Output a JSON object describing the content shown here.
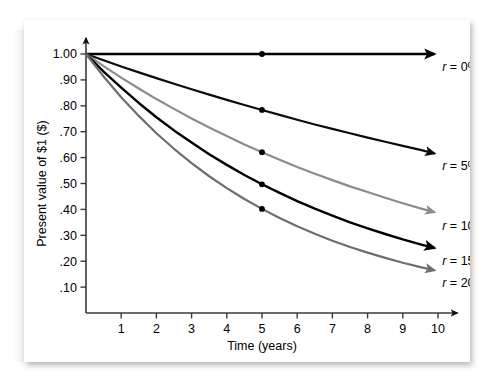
{
  "chart_data": {
    "type": "line",
    "title": "",
    "subtitle": "",
    "xlabel": "Time (years)",
    "ylabel": "Present value of $1 ($)",
    "xlim": [
      0,
      10.6
    ],
    "ylim": [
      0,
      1.06
    ],
    "xticks": [
      1,
      2,
      3,
      4,
      5,
      6,
      7,
      8,
      9,
      10
    ],
    "xtick_labels": [
      "1",
      "2",
      "3",
      "4",
      "5",
      "6",
      "7",
      "8",
      "9",
      "10"
    ],
    "yticks": [
      0.1,
      0.2,
      0.3,
      0.4,
      0.5,
      0.6,
      0.7,
      0.8,
      0.9,
      1.0
    ],
    "ytick_labels": [
      ".10",
      ".20",
      ".30",
      ".40",
      ".50",
      ".60",
      ".70",
      ".80",
      ".90",
      "1.00"
    ],
    "grid": false,
    "legend_position": "right-inline-end-of-line",
    "marker_x": 5,
    "x": [
      0,
      0.5,
      1,
      1.5,
      2,
      2.5,
      3,
      3.5,
      4,
      4.5,
      5,
      5.5,
      6,
      6.5,
      7,
      7.5,
      8,
      8.5,
      9,
      9.5,
      9.9
    ],
    "series": [
      {
        "name": "r = 0%",
        "rate": 0,
        "color": "#000000",
        "width": 2.4,
        "marker_value": 1.0,
        "end_value": 1.0,
        "values": [
          1.0,
          1.0,
          1.0,
          1.0,
          1.0,
          1.0,
          1.0,
          1.0,
          1.0,
          1.0,
          1.0,
          1.0,
          1.0,
          1.0,
          1.0,
          1.0,
          1.0,
          1.0,
          1.0,
          1.0,
          1.0
        ]
      },
      {
        "name": "r = 5%",
        "rate": 0.05,
        "color": "#0d0d0d",
        "width": 2.2,
        "marker_value": 0.784,
        "end_value": 0.614,
        "values": [
          1.0,
          0.976,
          0.952,
          0.929,
          0.907,
          0.885,
          0.864,
          0.843,
          0.823,
          0.803,
          0.784,
          0.765,
          0.746,
          0.728,
          0.711,
          0.694,
          0.677,
          0.661,
          0.645,
          0.63,
          0.616
        ]
      },
      {
        "name": "r = 10%",
        "rate": 0.1,
        "color": "#8c8c8c",
        "width": 2.2,
        "marker_value": 0.621,
        "end_value": 0.386,
        "values": [
          1.0,
          0.953,
          0.909,
          0.867,
          0.826,
          0.788,
          0.751,
          0.716,
          0.683,
          0.651,
          0.621,
          0.592,
          0.564,
          0.538,
          0.513,
          0.489,
          0.467,
          0.445,
          0.424,
          0.404,
          0.389
        ]
      },
      {
        "name": "r = 15%",
        "rate": 0.15,
        "color": "#000000",
        "width": 2.4,
        "marker_value": 0.497,
        "end_value": 0.25,
        "values": [
          1.0,
          0.932,
          0.87,
          0.811,
          0.756,
          0.705,
          0.658,
          0.613,
          0.572,
          0.533,
          0.497,
          0.464,
          0.432,
          0.403,
          0.376,
          0.35,
          0.327,
          0.305,
          0.284,
          0.265,
          0.251
        ]
      },
      {
        "name": "r = 20%",
        "rate": 0.2,
        "color": "#6e6e6e",
        "width": 2.2,
        "marker_value": 0.402,
        "end_value": 0.164,
        "values": [
          1.0,
          0.913,
          0.833,
          0.761,
          0.694,
          0.634,
          0.579,
          0.528,
          0.482,
          0.44,
          0.402,
          0.367,
          0.335,
          0.306,
          0.279,
          0.255,
          0.233,
          0.213,
          0.194,
          0.177,
          0.165
        ]
      }
    ],
    "legend_entries": [
      {
        "label": "r = 0%",
        "symbol": "r",
        "rest": " = 0%"
      },
      {
        "label": "r = 5%",
        "symbol": "r",
        "rest": " = 5%"
      },
      {
        "label": "r = 10%",
        "symbol": "r",
        "rest": " = 10%"
      },
      {
        "label": "r = 15%",
        "symbol": "r",
        "rest": " = 15%"
      },
      {
        "label": "r = 20%",
        "symbol": "r",
        "rest": " = 20%"
      }
    ]
  }
}
